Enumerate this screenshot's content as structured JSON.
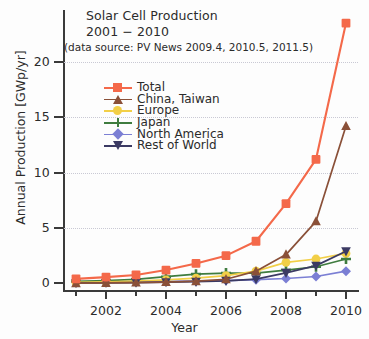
{
  "title": {
    "line1": "Solar Cell Production",
    "line2": "2001 − 2010",
    "subtitle": "(data source: PV News 2009.4, 2010.5, 2011.5)"
  },
  "axes": {
    "ylabel": "Annual Production [GWp/yr]",
    "xlabel": "Year",
    "yticks": [
      "0",
      "5",
      "10",
      "15",
      "20"
    ],
    "xticks": [
      "2002",
      "2004",
      "2006",
      "2008",
      "2010"
    ]
  },
  "legend": [
    {
      "label": "Total",
      "color": "#f4694a",
      "marker": "square"
    },
    {
      "label": "China, Taiwan",
      "color": "#8a5038",
      "marker": "triangle-up"
    },
    {
      "label": "Europe",
      "color": "#f2cf47",
      "marker": "circle"
    },
    {
      "label": "Japan",
      "color": "#3f7c3f",
      "marker": "plus"
    },
    {
      "label": "North America",
      "color": "#7b7fd4",
      "marker": "diamond"
    },
    {
      "label": "Rest of World",
      "color": "#3b3a63",
      "marker": "triangle-down"
    }
  ],
  "chart_data": {
    "type": "line",
    "title": "Solar Cell Production 2001 − 2010",
    "subtitle": "(data source: PV News 2009.4, 2010.5, 2011.5)",
    "xlabel": "Year",
    "ylabel": "Annual Production [GWp/yr]",
    "x": [
      2001,
      2002,
      2003,
      2004,
      2005,
      2006,
      2007,
      2008,
      2009,
      2010
    ],
    "xlim": [
      2000.6,
      2010.4
    ],
    "ylim": [
      -0.6,
      24.5
    ],
    "yticks": [
      0,
      5,
      10,
      15,
      20
    ],
    "xticks": [
      2002,
      2004,
      2006,
      2008,
      2010
    ],
    "grid": "horizontal-dotted",
    "legend_position": "upper-left-inside",
    "series": [
      {
        "name": "Total",
        "color": "#f4694a",
        "marker": "square",
        "values": [
          0.4,
          0.56,
          0.76,
          1.2,
          1.8,
          2.5,
          3.8,
          7.2,
          11.2,
          23.5
        ]
      },
      {
        "name": "China, Taiwan",
        "color": "#8a5038",
        "marker": "triangle-up",
        "values": [
          0.02,
          0.04,
          0.07,
          0.12,
          0.2,
          0.37,
          1.1,
          2.6,
          5.6,
          14.2
        ]
      },
      {
        "name": "Europe",
        "color": "#f2cf47",
        "marker": "circle",
        "values": [
          0.08,
          0.13,
          0.2,
          0.31,
          0.47,
          0.69,
          1.1,
          1.9,
          2.2,
          2.7
        ]
      },
      {
        "name": "Japan",
        "color": "#3f7c3f",
        "marker": "plus",
        "values": [
          0.17,
          0.25,
          0.36,
          0.6,
          0.83,
          0.93,
          0.92,
          1.2,
          1.5,
          2.2
        ]
      },
      {
        "name": "North America",
        "color": "#7b7fd4",
        "marker": "diamond",
        "values": [
          0.1,
          0.12,
          0.13,
          0.17,
          0.2,
          0.25,
          0.33,
          0.44,
          0.62,
          1.1
        ]
      },
      {
        "name": "Rest of World",
        "color": "#3b3a63",
        "marker": "triangle-down",
        "values": [
          0.03,
          0.05,
          0.07,
          0.11,
          0.15,
          0.23,
          0.38,
          0.95,
          1.6,
          2.9
        ]
      }
    ]
  }
}
